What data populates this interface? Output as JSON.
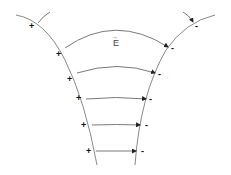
{
  "diagram": {
    "type": "electric-field-between-curved-conductors",
    "field_label": "E",
    "field_label_vector_arrow": "→",
    "positive_sign": "+",
    "negative_sign": "-",
    "positive_charge_count": 6,
    "negative_charge_count": 6,
    "field_line_count": 6,
    "colors": {
      "lines": "#8a8a8a",
      "signs": "#111111",
      "background": "#ffffff"
    }
  }
}
